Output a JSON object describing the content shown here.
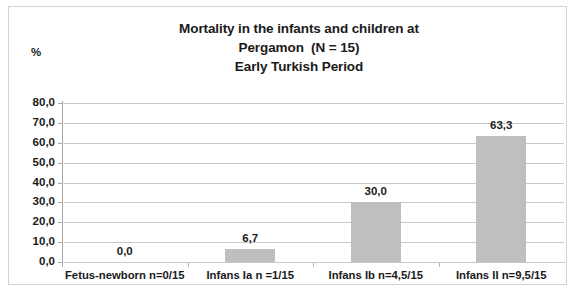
{
  "chart_data": {
    "type": "bar",
    "title": "Mortality in the infants and children at Pergamon  (N = 15) Early Turkish Period",
    "title_lines": [
      "Mortality in the infants and children at",
      "Pergamon  (N = 15)",
      "Early Turkish Period"
    ],
    "categories": [
      "Fetus-newborn n=0/15",
      "Infans Ia n =1/15",
      "Infans Ib n=4,5/15",
      "Infans II n=9,5/15"
    ],
    "values": [
      0.0,
      6.7,
      30.0,
      63.3
    ],
    "value_labels": [
      "0,0",
      "6,7",
      "30,0",
      "63,3"
    ],
    "xlabel": "",
    "ylabel": "%",
    "ylim": [
      0,
      80
    ],
    "ytick_values": [
      0,
      10,
      20,
      30,
      40,
      50,
      60,
      70,
      80
    ],
    "ytick_labels": [
      "0,0",
      "10,0",
      "20,0",
      "30,0",
      "40,0",
      "50,0",
      "60,0",
      "70,0",
      "80,0"
    ],
    "grid": true,
    "legend": false,
    "bar_color": "#bfbfbf",
    "gridline_color": "#c8c8c8",
    "axis_color": "#a6a6a6",
    "text_color": "#1a1a1a",
    "decimal_separator": ","
  }
}
